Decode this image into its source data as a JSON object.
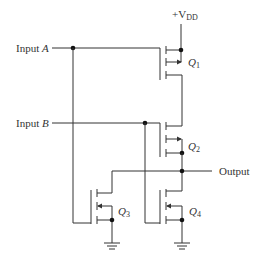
{
  "diagram": {
    "type": "CMOS NAND/NOR-style circuit schematic",
    "supply": {
      "label": "+V",
      "subscript": "DD"
    },
    "inputs": [
      {
        "label": "Input ",
        "var": "A"
      },
      {
        "label": "Input ",
        "var": "B"
      }
    ],
    "output": {
      "label": "Output"
    },
    "transistors": [
      {
        "name": "Q",
        "sub": "1"
      },
      {
        "name": "Q",
        "sub": "2"
      },
      {
        "name": "Q",
        "sub": "3"
      },
      {
        "name": "Q",
        "sub": "4"
      }
    ],
    "colors": {
      "line": "#333333",
      "background": "#ffffff"
    }
  }
}
